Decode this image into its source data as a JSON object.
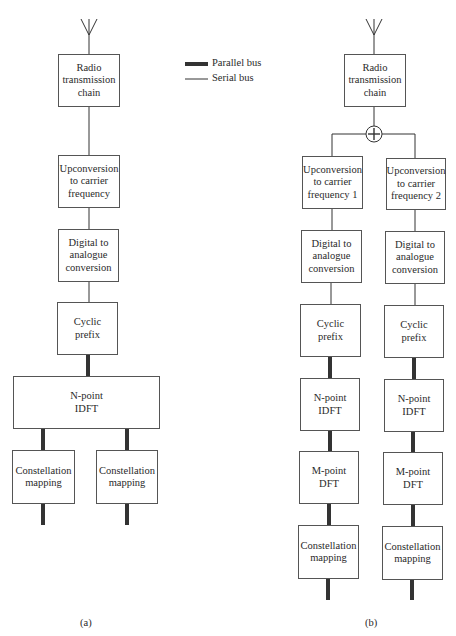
{
  "legend": {
    "parallel_bus": "Parallel bus",
    "serial_bus": "Serial bus"
  },
  "diagram_a": {
    "caption": "(a)",
    "blocks": {
      "radio": "Radio\ntransmission\nchain",
      "upconversion": "Upconversion\nto carrier\nfrequency",
      "dac": "Digital to\nanalogue\nconversion",
      "cyclic_prefix": "Cyclic\nprefix",
      "idft": "N-point\nIDFT",
      "constellation_1": "Constellation\nmapping",
      "constellation_2": "Constellation\nmapping"
    }
  },
  "diagram_b": {
    "caption": "(b)",
    "adder_symbol": "+",
    "blocks": {
      "radio": "Radio\ntransmission\nchain",
      "upconversion_1": "Upconversion\nto carrier\nfrequency 1",
      "upconversion_2": "Upconversion\nto carrier\nfrequency 2",
      "dac_1": "Digital to\nanalogue\nconversion",
      "dac_2": "Digital to\nanalogue\nconversion",
      "cyclic_prefix_1": "Cyclic\nprefix",
      "cyclic_prefix_2": "Cyclic\nprefix",
      "idft_1": "N-point\nIDFT",
      "idft_2": "N-point\nIDFT",
      "dft_1": "M-point\nDFT",
      "dft_2": "M-point\nDFT",
      "constellation_1": "Constellation\nmapping",
      "constellation_2": "Constellation\nmapping"
    }
  }
}
